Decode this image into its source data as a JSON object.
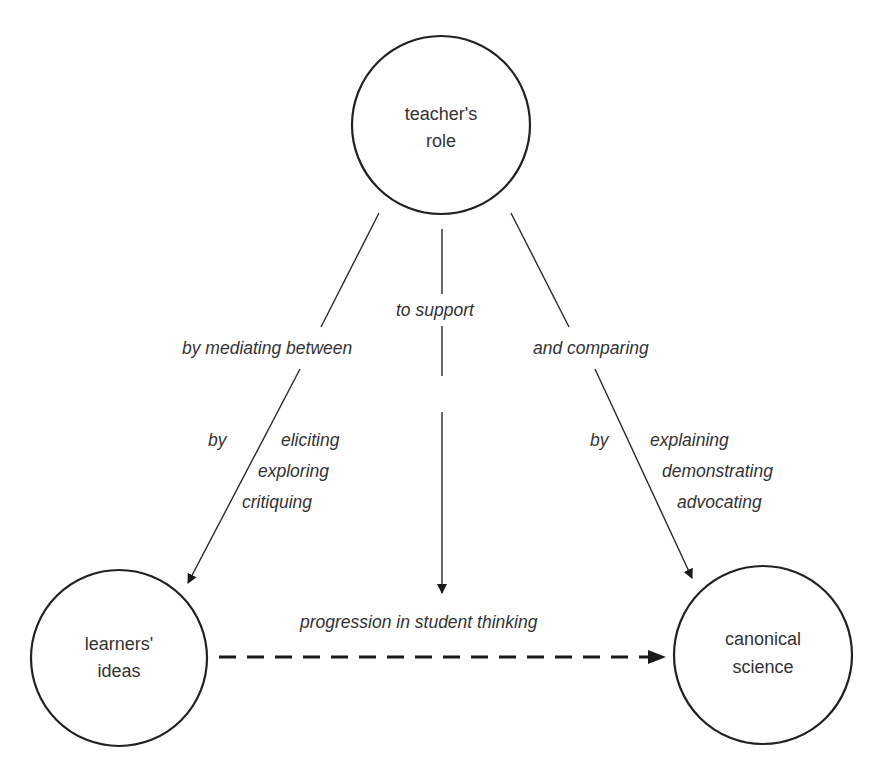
{
  "nodes": {
    "teacher": {
      "line1": "teacher's",
      "line2": "role"
    },
    "learners": {
      "line1": "learners'",
      "line2": "ideas"
    },
    "canonical": {
      "line1": "canonical",
      "line2": "science"
    }
  },
  "edges": {
    "left": {
      "label": "by mediating between",
      "by": "by",
      "methods": [
        "eliciting",
        "exploring",
        "critiquing"
      ]
    },
    "center": {
      "label": "to support"
    },
    "right": {
      "label": "and comparing",
      "by": "by",
      "methods": [
        "explaining",
        "demonstrating",
        "advocating"
      ]
    },
    "bottom": {
      "label": "progression in student thinking"
    }
  },
  "colors": {
    "stroke": "#222222",
    "text": "#333333",
    "background": "#ffffff"
  }
}
